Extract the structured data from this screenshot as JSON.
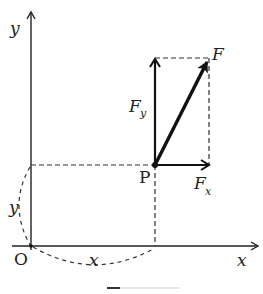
{
  "diagram": {
    "type": "vector-decomposition",
    "axes": {
      "x_label": "x",
      "y_label": "y",
      "origin_label": "O"
    },
    "point": {
      "label": "P"
    },
    "vectors": {
      "force_label": "F",
      "fx_label": "F",
      "fx_sub": "x",
      "fy_label": "F",
      "fy_sub": "y"
    },
    "distances": {
      "horizontal_label": "x",
      "vertical_label": "y"
    },
    "colors": {
      "line": "#222222",
      "dashed": "#333333",
      "background": "#ffffff"
    }
  }
}
